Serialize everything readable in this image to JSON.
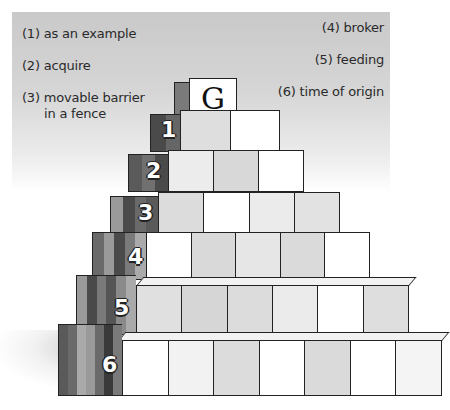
{
  "puzzle": {
    "cap_letter": "G",
    "clues_left": [
      {
        "label": "(1) as an example"
      },
      {
        "label": "(2) acquire"
      },
      {
        "label": "(3) movable barrier",
        "label2": "in a fence"
      }
    ],
    "clues_right": [
      {
        "label": "(4) broker"
      },
      {
        "label": "(5) feeding"
      },
      {
        "label": "(6) time of origin"
      }
    ],
    "rows": [
      {
        "number": "1",
        "blocks": 2
      },
      {
        "number": "2",
        "blocks": 3
      },
      {
        "number": "3",
        "blocks": 4
      },
      {
        "number": "4",
        "blocks": 5
      },
      {
        "number": "5",
        "blocks": 6
      },
      {
        "number": "6",
        "blocks": 7
      }
    ]
  },
  "colors": {
    "panel_top": "#c9c9c9",
    "block_white": "#ffffff",
    "block_gray": "#dcdcdc",
    "side_dark": "#555555",
    "outline": "#222222"
  }
}
